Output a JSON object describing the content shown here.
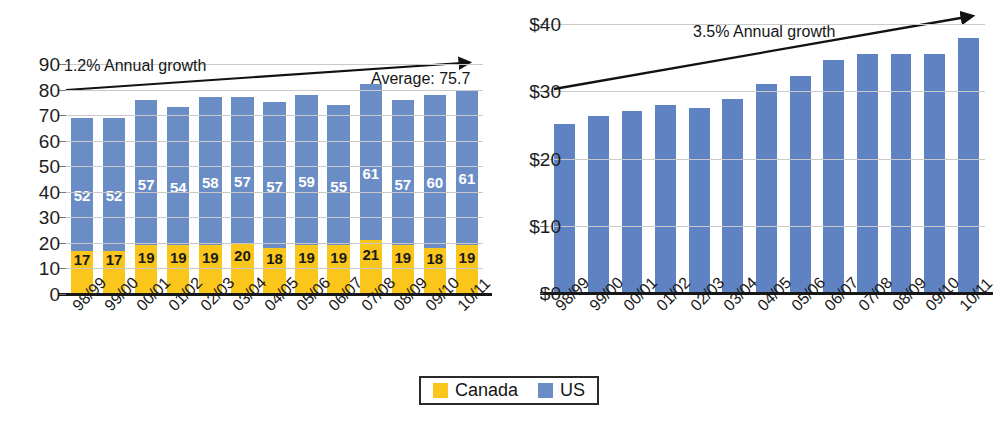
{
  "chart_data": [
    {
      "type": "bar",
      "id": "enrolment-stacked",
      "title": "",
      "xlabel": "",
      "ylabel": "",
      "stacked": true,
      "grid": true,
      "legend_position": "bottom",
      "ylim": [
        0,
        90
      ],
      "yticks": [
        0,
        10,
        20,
        30,
        40,
        50,
        60,
        70,
        80,
        90
      ],
      "ytick_labels": [
        "0",
        "10",
        "20",
        "30",
        "40",
        "50",
        "60",
        "70",
        "80",
        "90"
      ],
      "categories": [
        "98/99",
        "99/00",
        "00/01",
        "01/02",
        "02/03",
        "03/04",
        "04/05",
        "05/06",
        "06/07",
        "07/08",
        "08/09",
        "09/10",
        "10/11"
      ],
      "series": [
        {
          "name": "Canada",
          "color": "#fac61c",
          "values": [
            17,
            17,
            19,
            19,
            19,
            20,
            18,
            19,
            19,
            21,
            19,
            18,
            19
          ]
        },
        {
          "name": "US",
          "color": "#6b8dc6",
          "values": [
            52,
            52,
            57,
            54,
            58,
            57,
            57,
            59,
            55,
            61,
            57,
            60,
            61
          ]
        }
      ],
      "totals": [
        69,
        69,
        76,
        73,
        77,
        77,
        75,
        78,
        74,
        82,
        76,
        78,
        80
      ],
      "annotations": [
        {
          "text": "1.2% Annual growth",
          "kind": "growth-rate"
        },
        {
          "text": "Average: 75.7",
          "kind": "average"
        }
      ]
    },
    {
      "type": "bar",
      "id": "value-column",
      "title": "",
      "xlabel": "",
      "ylabel": "",
      "stacked": false,
      "grid": true,
      "ylim": [
        0,
        40
      ],
      "yticks": [
        0,
        10,
        20,
        30,
        40
      ],
      "ytick_labels": [
        "$0",
        "$10",
        "$20",
        "$30",
        "$40"
      ],
      "categories": [
        "98/99",
        "99/00",
        "00/01",
        "01/02",
        "02/03",
        "03/04",
        "04/05",
        "05/06",
        "06/07",
        "07/08",
        "08/09",
        "09/10",
        "10/11"
      ],
      "series": [
        {
          "name": "Value",
          "color": "#5f82c2",
          "values": [
            25.2,
            26.3,
            27.1,
            28.0,
            27.5,
            28.9,
            31.1,
            32.2,
            34.6,
            35.6,
            35.6,
            35.5,
            37.9
          ]
        }
      ],
      "annotations": [
        {
          "text": "3.5% Annual growth",
          "kind": "growth-rate"
        }
      ]
    }
  ],
  "legend": {
    "items": [
      {
        "label": "Canada",
        "color": "#fac61c",
        "swatch": "canada-swatch"
      },
      {
        "label": "US",
        "color": "#6b8dc6",
        "swatch": "us-swatch"
      }
    ]
  },
  "colors": {
    "us_blue": "#6b8dc6",
    "canada_yellow": "#fac61c",
    "column_blue": "#5f82c2",
    "gridline": "#c9c9c9",
    "axis": "#171717",
    "text": "#1b1b1b"
  }
}
